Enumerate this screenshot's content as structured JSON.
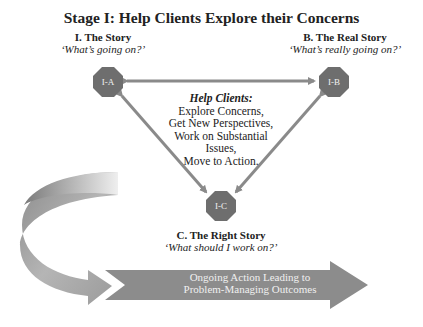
{
  "title": "Stage I: Help Clients Explore their Concerns",
  "nodes": {
    "a": {
      "id": "I-A",
      "heading": "I. The Story",
      "question": "‘What’s going on?’"
    },
    "b": {
      "id": "I-B",
      "heading": "B. The Real Story",
      "question": "‘What’s really going on?’"
    },
    "c": {
      "id": "I-C",
      "heading": "C. The Right Story",
      "question": "‘What should I work on?’"
    }
  },
  "center": {
    "heading": "Help Clients:",
    "lines": [
      "Explore Concerns,",
      "Get New Perspectives,",
      "Work on Substantial",
      "Issues,",
      "Move to Action."
    ]
  },
  "bottom_arrow": {
    "line1": "Ongoing Action Leading to",
    "line2": "Problem-Managing Outcomes"
  },
  "colors": {
    "octagon": "#6e6e6e",
    "arrow_line": "#8a8a8a",
    "big_arrow": "#8c8c8c",
    "text": "#222222"
  }
}
